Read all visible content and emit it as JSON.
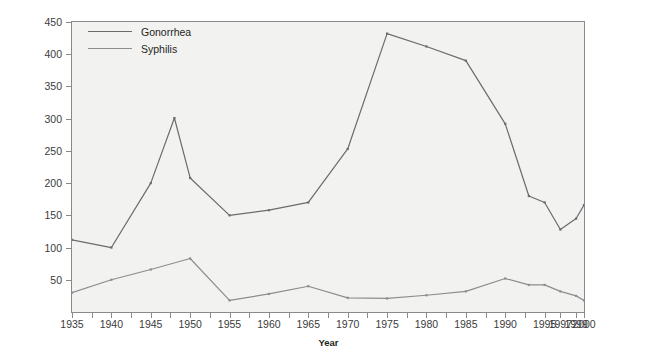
{
  "chart_data": {
    "type": "line",
    "title": "",
    "xlabel": "Year",
    "ylabel": "Cases/100,000 Population (U.S.A.)",
    "xlim": [
      1935,
      2000
    ],
    "ylim": [
      0,
      450
    ],
    "grid": false,
    "legend_position": "top-left",
    "y_ticks": [
      450,
      400,
      350,
      300,
      250,
      200,
      150,
      100,
      50
    ],
    "x_ticks": [
      1935,
      1940,
      1945,
      1950,
      1955,
      1960,
      1965,
      1970,
      1975,
      1980,
      1985,
      1990,
      1995,
      1997,
      1999,
      2000
    ],
    "x_minor_ticks": [
      1937.5,
      1942.5,
      1947.5,
      1952.5,
      1957.5,
      1962.5,
      1967.5,
      1972.5,
      1977.5,
      1982.5,
      1987.5,
      1992.5
    ],
    "series": [
      {
        "name": "Gonorrhea",
        "color": "#6b6b6b",
        "width": 1.2,
        "x": [
          1935,
          1940,
          1945,
          1948,
          1950,
          1955,
          1960,
          1965,
          1970,
          1975,
          1980,
          1985,
          1990,
          1993,
          1995,
          1997,
          1999,
          2000
        ],
        "values": [
          112,
          100,
          200,
          301,
          208,
          150,
          158,
          170,
          253,
          432,
          412,
          390,
          292,
          180,
          170,
          128,
          145,
          166
        ]
      },
      {
        "name": "Syphilis",
        "color": "#8d8d8d",
        "width": 1.2,
        "x": [
          1935,
          1940,
          1945,
          1950,
          1955,
          1960,
          1965,
          1970,
          1975,
          1980,
          1985,
          1990,
          1993,
          1995,
          1997,
          1999,
          2000
        ],
        "values": [
          30,
          50,
          66,
          83,
          18,
          28,
          40,
          22,
          21,
          26,
          32,
          52,
          42,
          42,
          32,
          25,
          18
        ]
      }
    ]
  },
  "axes": {
    "y_title": "Cases/100,000 Population (U.S.A.)",
    "x_title": "Year"
  },
  "legend": {
    "entries": [
      {
        "label": "Gonorrhea"
      },
      {
        "label": "Syphilis"
      }
    ]
  },
  "colors": {
    "plot_background": "#f2f2f0",
    "frame": "#8a8a8a",
    "text": "#231f20",
    "tick_text": "#3b3b3b",
    "gonorrhea": "#6b6b6b",
    "syphilis": "#8d8d8d"
  }
}
